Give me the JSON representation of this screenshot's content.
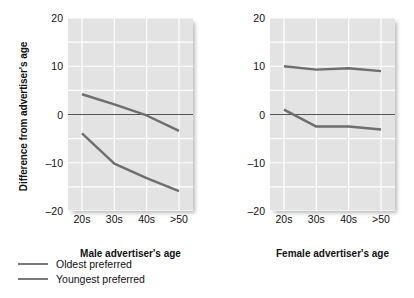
{
  "chart_data": {
    "type": "line",
    "title": "",
    "ylabel": "Difference from advertiser's age",
    "ylim": [
      -20,
      20
    ],
    "yticks": [
      20,
      10,
      0,
      -10,
      -20
    ],
    "ytick_labels": [
      "20",
      "10",
      "0",
      "–10",
      "–20"
    ],
    "gridlines": [
      20,
      15,
      10,
      5,
      0,
      -5,
      -10,
      -15,
      -20
    ],
    "grid": true,
    "legend_position": "below-left",
    "zero_line": 0,
    "categories": [
      "20s",
      "30s",
      "40s",
      ">50"
    ],
    "legend": [
      "Oldest preferred",
      "Youngest preferred"
    ],
    "panels": [
      {
        "name": "male",
        "xlabel": "Male advertiser's age",
        "categories": [
          "20s",
          "30s",
          "40s",
          ">50"
        ],
        "series": [
          {
            "name": "Oldest preferred",
            "values": [
              4.2,
              2.1,
              -0.2,
              -3.4
            ]
          },
          {
            "name": "Youngest preferred",
            "values": [
              -3.9,
              -10.2,
              -13.2,
              -15.9
            ]
          }
        ]
      },
      {
        "name": "female",
        "xlabel": "Female advertiser's age",
        "categories": [
          "20s",
          "30s",
          "40s",
          ">50"
        ],
        "series": [
          {
            "name": "Oldest preferred",
            "values": [
              10.0,
              9.3,
              9.6,
              9.0
            ]
          },
          {
            "name": "Youngest preferred",
            "values": [
              1.0,
              -2.5,
              -2.5,
              -3.1
            ]
          }
        ]
      }
    ],
    "colors": {
      "plot_background": "#e3e3e3",
      "gridline": "#ffffff",
      "line": "#6e6e6e",
      "zero_line": "#555555",
      "text": "#111111",
      "page_background": "#ffffff"
    }
  }
}
